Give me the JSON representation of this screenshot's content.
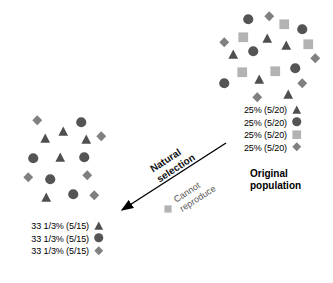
{
  "diagram": {
    "title_original": "Original\npopulation",
    "colors": {
      "triangle": "#4f4f4f",
      "circle": "#545454",
      "square": "#b3b3b3",
      "diamond": "#808080",
      "arrow": "#000000",
      "background": "#ffffff"
    },
    "original_population": {
      "caption_line1": "Original",
      "caption_line2": "population",
      "legend": [
        {
          "label": "25% (5/20)",
          "shape": "triangle-icon"
        },
        {
          "label": "25% (5/20)",
          "shape": "circle-icon"
        },
        {
          "label": "25% (5/20)",
          "shape": "square-icon"
        },
        {
          "label": "25% (5/20)",
          "shape": "diamond-icon"
        }
      ],
      "shapes": [
        {
          "type": "circle",
          "x": 243,
          "y": 14
        },
        {
          "type": "diamond",
          "x": 264,
          "y": 11
        },
        {
          "type": "square",
          "x": 279,
          "y": 19
        },
        {
          "type": "circle",
          "x": 297,
          "y": 24
        },
        {
          "type": "diamond",
          "x": 219,
          "y": 37
        },
        {
          "type": "square",
          "x": 238,
          "y": 32
        },
        {
          "type": "triangle",
          "x": 262,
          "y": 33
        },
        {
          "type": "triangle",
          "x": 281,
          "y": 40
        },
        {
          "type": "square",
          "x": 303,
          "y": 39
        },
        {
          "type": "triangle",
          "x": 228,
          "y": 49
        },
        {
          "type": "circle",
          "x": 248,
          "y": 46
        },
        {
          "type": "diamond",
          "x": 310,
          "y": 53
        },
        {
          "type": "square",
          "x": 237,
          "y": 67
        },
        {
          "type": "square",
          "x": 270,
          "y": 66
        },
        {
          "type": "circle",
          "x": 290,
          "y": 63
        },
        {
          "type": "circle",
          "x": 219,
          "y": 78
        },
        {
          "type": "triangle",
          "x": 254,
          "y": 74
        },
        {
          "type": "diamond",
          "x": 297,
          "y": 78
        },
        {
          "type": "diamond",
          "x": 252,
          "y": 92
        },
        {
          "type": "triangle",
          "x": 283,
          "y": 89
        }
      ]
    },
    "selected_population": {
      "legend": [
        {
          "label": "33 1/3% (5/15)",
          "shape": "triangle-icon"
        },
        {
          "label": "33 1/3% (5/15)",
          "shape": "circle-icon"
        },
        {
          "label": "33 1/3% (5/15)",
          "shape": "diamond-icon"
        }
      ],
      "shapes": [
        {
          "type": "diamond",
          "x": 32,
          "y": 115
        },
        {
          "type": "circle",
          "x": 76,
          "y": 117
        },
        {
          "type": "triangle",
          "x": 58,
          "y": 126
        },
        {
          "type": "triangle",
          "x": 40,
          "y": 133
        },
        {
          "type": "triangle",
          "x": 81,
          "y": 134
        },
        {
          "type": "diamond",
          "x": 96,
          "y": 131
        },
        {
          "type": "circle",
          "x": 28,
          "y": 153
        },
        {
          "type": "triangle",
          "x": 55,
          "y": 152
        },
        {
          "type": "circle",
          "x": 79,
          "y": 152
        },
        {
          "type": "diamond",
          "x": 23,
          "y": 172
        },
        {
          "type": "circle",
          "x": 45,
          "y": 174
        },
        {
          "type": "diamond",
          "x": 82,
          "y": 170
        },
        {
          "type": "triangle",
          "x": 41,
          "y": 192
        },
        {
          "type": "circle",
          "x": 68,
          "y": 189
        },
        {
          "type": "diamond",
          "x": 89,
          "y": 190
        }
      ]
    },
    "arrow": {
      "label_line1": "Natural",
      "label_line2": "selection",
      "note_line1": "Cannot",
      "note_line2": "reproduce",
      "note_shape": "square-icon"
    }
  }
}
